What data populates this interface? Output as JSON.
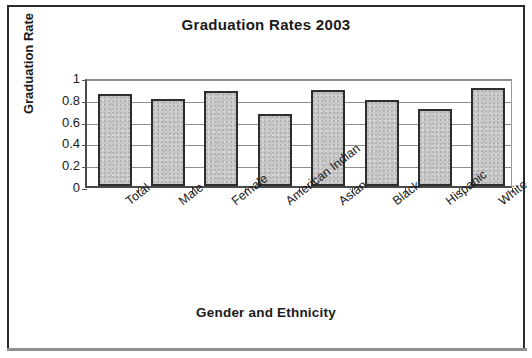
{
  "figure": {
    "frame_color": "#2b2b2b",
    "background": "#ffffff"
  },
  "chart_data": {
    "type": "bar",
    "title": "Graduation Rates 2003",
    "xlabel": "Gender and Ethnicity",
    "ylabel": "Graduation Rate",
    "categories": [
      "Total",
      "Male",
      "Female",
      "American Indian",
      "Asian",
      "Black",
      "Hispanic",
      "White"
    ],
    "values": [
      0.84,
      0.8,
      0.87,
      0.66,
      0.88,
      0.79,
      0.71,
      0.9
    ],
    "ylim": [
      0,
      1
    ],
    "yticks": [
      0,
      0.2,
      0.4,
      0.6,
      0.8,
      1
    ],
    "ytick_labels": [
      "0",
      "0.2",
      "0.4",
      "0.6",
      "0.8",
      "1"
    ],
    "grid": true,
    "grid_axis": "y",
    "legend": false,
    "bar_fill_color": "#c9c9c9",
    "bar_edge_color": "#2e2e2e",
    "gridline_color": "#8e8e8e",
    "axis_color": "#4a4a4a",
    "xlabel_rotation": -38,
    "series": [
      {
        "name": "Graduation Rate",
        "values": [
          0.84,
          0.8,
          0.87,
          0.66,
          0.88,
          0.79,
          0.71,
          0.9
        ]
      }
    ]
  }
}
